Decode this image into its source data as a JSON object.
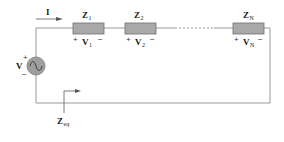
{
  "diagram": {
    "type": "series-impedance-circuit",
    "colors": {
      "wire": "#9a9a9a",
      "impedance_fill": "#a9a9a9",
      "impedance_stroke": "#6e6e6e",
      "source_fill": "#9e9e9e",
      "text": "#1a1a1a",
      "background": "#ffffff"
    },
    "current": {
      "label": "I",
      "direction": "right"
    },
    "source": {
      "label": "V",
      "symbol": "ac-sine",
      "plus": "+",
      "minus": "−"
    },
    "impedances": [
      {
        "name": "Z",
        "sub": "1",
        "voltage": "V",
        "voltage_sub": "1",
        "plus": "+",
        "minus": "−"
      },
      {
        "name": "Z",
        "sub": "2",
        "voltage": "V",
        "voltage_sub": "2",
        "plus": "+",
        "minus": "−"
      },
      {
        "name": "Z",
        "sub": "N",
        "voltage": "V",
        "voltage_sub": "N",
        "plus": "+",
        "minus": "−"
      }
    ],
    "continuation": "dashed-line",
    "equivalent": {
      "label": "Z",
      "sub": "eq",
      "arrow_direction": "right"
    }
  }
}
